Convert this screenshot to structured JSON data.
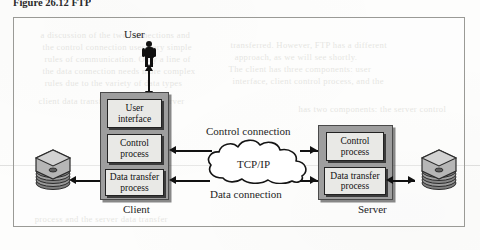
{
  "figure": {
    "caption": "Figure 26.12   FTP",
    "frame_border_color": "#9a9a96"
  },
  "diagram": {
    "actor": {
      "label": "User",
      "icon": "person-icon"
    },
    "client": {
      "label": "Client",
      "fill_color": "#9e9e9e",
      "boxes": [
        {
          "id": "user-interface",
          "label": "User\ninterface",
          "line1": "User",
          "line2": "interface"
        },
        {
          "id": "control-process",
          "label": "Control process",
          "line1": "Control",
          "line2": "process"
        },
        {
          "id": "data-transfer-process",
          "label": "Data transfer process",
          "line1": "Data transfer",
          "line2": "process"
        }
      ],
      "storage_icon": "disk-stack-icon"
    },
    "server": {
      "label": "Server",
      "fill_color": "#9e9e9e",
      "boxes": [
        {
          "id": "control-process",
          "label": "Control process",
          "line1": "Control",
          "line2": "process"
        },
        {
          "id": "data-transfer-process",
          "label": "Data transfer process",
          "line1": "Data transfer",
          "line2": "process"
        }
      ],
      "storage_icon": "disk-stack-icon"
    },
    "network": {
      "label": "TCP/IP",
      "icon": "cloud-icon"
    },
    "connections": [
      {
        "id": "control-connection",
        "label": "Control connection",
        "position": "above-cloud"
      },
      {
        "id": "data-connection",
        "label": "Data connection",
        "position": "below-cloud"
      }
    ]
  },
  "background_ghost_text": [
    "a discussion of the two connections and",
    "the control connection uses very simple",
    "rules of communication. Only a line of",
    "the data connection needs more complex",
    "rules due to the variety of data types",
    "transferred. However, FTP has a different",
    "approach, as we will see shortly.",
    "The client has three components: user",
    "interface, client control process, and the",
    "client data transfer process. The server",
    "has two components: the server control",
    "process and the server data transfer"
  ]
}
